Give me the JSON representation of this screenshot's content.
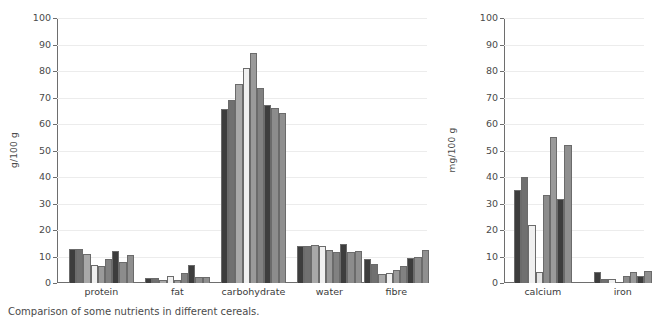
{
  "caption": "Comparison of some nutrients in different cereals.",
  "chart_data": [
    {
      "type": "bar",
      "title": "",
      "xlabel": "",
      "ylabel": "g/100 g",
      "ylim": [
        0,
        100
      ],
      "yticks": [
        0,
        10,
        20,
        30,
        40,
        50,
        60,
        70,
        80,
        90,
        100
      ],
      "grid": true,
      "legend": "none",
      "categories": [
        "protein",
        "fat",
        "carbohydrate",
        "water",
        "fibre"
      ],
      "series": [
        {
          "name": "cereal 1",
          "color": "#3d3d3d",
          "values": [
            12.7,
            2.0,
            65.8,
            13.8,
            9.0
          ]
        },
        {
          "name": "cereal 2",
          "color": "#707070",
          "values": [
            13.0,
            2.0,
            69.0,
            13.9,
            7.0
          ]
        },
        {
          "name": "cereal 3",
          "color": "#a8a8a8",
          "values": [
            10.8,
            1.2,
            75.0,
            14.4,
            3.5
          ]
        },
        {
          "name": "cereal 4",
          "color": "#f0f0f0",
          "values": [
            6.7,
            2.8,
            81.2,
            13.9,
            3.6
          ]
        },
        {
          "name": "cereal 5",
          "color": "#9a9a9a",
          "values": [
            6.4,
            1.0,
            86.7,
            12.3,
            4.8
          ]
        },
        {
          "name": "cereal 6",
          "color": "#818181",
          "values": [
            9.2,
            3.6,
            73.5,
            11.7,
            6.5
          ]
        },
        {
          "name": "cereal 7",
          "color": "#3d3d3d",
          "values": [
            11.9,
            6.7,
            67.2,
            14.6,
            9.5
          ]
        },
        {
          "name": "cereal 8",
          "color": "#8c8c8c",
          "values": [
            8.0,
            2.1,
            66.0,
            11.8,
            10.0
          ]
        },
        {
          "name": "cereal 9",
          "color": "#8f8f8f",
          "values": [
            10.4,
            2.3,
            64.1,
            12.0,
            12.4
          ]
        }
      ]
    },
    {
      "type": "bar",
      "title": "",
      "xlabel": "",
      "ylabel": "mg/100 g",
      "ylim": [
        0,
        100
      ],
      "yticks": [
        0,
        10,
        20,
        30,
        40,
        50,
        60,
        70,
        80,
        90,
        100
      ],
      "grid": true,
      "legend": "none",
      "categories": [
        "calcium",
        "iron"
      ],
      "series": [
        {
          "name": "cereal 1",
          "color": "#3d3d3d",
          "values": [
            35.0,
            4.0
          ]
        },
        {
          "name": "cereal 2",
          "color": "#707070",
          "values": [
            40.0,
            1.7
          ]
        },
        {
          "name": "cereal 3",
          "color": "#f0f0f0",
          "values": [
            22.0,
            1.5
          ]
        },
        {
          "name": "cereal 4",
          "color": "#e4e4e4",
          "values": [
            4.2,
            0.5
          ]
        },
        {
          "name": "cereal 5",
          "color": "#8c8c8c",
          "values": [
            33.3,
            2.7
          ]
        },
        {
          "name": "cereal 6",
          "color": "#9a9a9a",
          "values": [
            55.0,
            4.0
          ]
        },
        {
          "name": "cereal 7",
          "color": "#3d3d3d",
          "values": [
            31.8,
            2.5
          ]
        },
        {
          "name": "cereal 8",
          "color": "#8f8f8f",
          "values": [
            52.2,
            4.7
          ]
        }
      ]
    }
  ]
}
